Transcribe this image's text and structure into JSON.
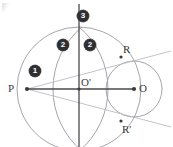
{
  "figure": {
    "background_color": "#ffffff",
    "line_color_primary": "#4a4a4f",
    "line_color_light": "#b9b9be",
    "line_color_arc": "#9a9aa0",
    "label_color": "#3a3a3a",
    "badge_fill": "#2f2f33",
    "badge_text_color": "#ffffff"
  },
  "points": [
    {
      "id": "P",
      "label": "P",
      "x": 27,
      "y": 89,
      "label_x": 8,
      "label_y": 83,
      "dot": true
    },
    {
      "id": "Oc",
      "label": "O'",
      "x": 79,
      "y": 89,
      "label_x": 81,
      "label_y": 77,
      "dot": true
    },
    {
      "id": "O",
      "label": "O",
      "x": 134,
      "y": 89,
      "label_x": 139,
      "label_y": 83,
      "dot": true
    },
    {
      "id": "R",
      "label": "R",
      "x": 121,
      "y": 57,
      "label_x": 123,
      "label_y": 44,
      "dot": true
    },
    {
      "id": "Rp",
      "label": "R'",
      "x": 121,
      "y": 121,
      "label_x": 122,
      "label_y": 124,
      "dot": true
    }
  ],
  "steps": [
    {
      "number": "❶",
      "order": 1,
      "x": 29,
      "y": 65,
      "meaning": "draw segment P to O"
    },
    {
      "number": "❷",
      "order": 2,
      "x": 57,
      "y": 39,
      "meaning": "arc from P"
    },
    {
      "number": "❷",
      "order": 2,
      "x": 84,
      "y": 39,
      "meaning": "arc from O"
    },
    {
      "number": "❸",
      "order": 3,
      "x": 77,
      "y": 10,
      "meaning": "perpendicular bisector of PO"
    }
  ],
  "shapes": {
    "big_circle": {
      "name": "circle-centered-at-O-prime",
      "cx": 79,
      "cy": 89,
      "r": 62
    },
    "right_circle": {
      "name": "circle-centered-at-O",
      "cx": 134,
      "cy": 89,
      "r": 28
    },
    "arc_left": {
      "name": "construction-arc-from-P",
      "cx": 27,
      "cy": 89,
      "r": 81
    },
    "arc_right": {
      "name": "construction-arc-from-O",
      "cx": 134,
      "cy": 89,
      "r": 81
    }
  },
  "lines": {
    "base_line": {
      "name": "segment-P-to-O",
      "x1": 27,
      "y1": 89,
      "x2": 134,
      "y2": 89
    },
    "vertical_line": {
      "name": "perpendicular-bisector",
      "x1": 79,
      "y1": 4,
      "x2": 79,
      "y2": 147
    },
    "tangent_upper": {
      "name": "tangent-line-through-R",
      "x1": 27,
      "y1": 89,
      "x2": 171,
      "y2": 51
    },
    "tangent_lower": {
      "name": "tangent-line-through-R-prime",
      "x1": 27,
      "y1": 89,
      "x2": 171,
      "y2": 127
    }
  }
}
